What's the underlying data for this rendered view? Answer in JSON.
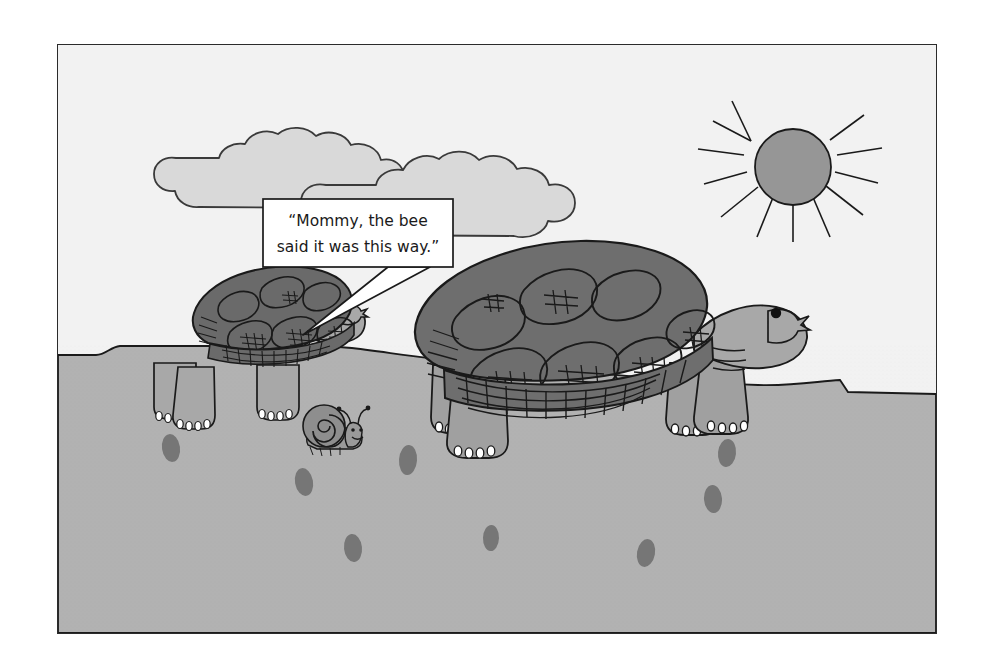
{
  "canvas": {
    "width": 994,
    "height": 669,
    "background": "#ffffff"
  },
  "panel": {
    "x": 57,
    "y": 44,
    "width": 878,
    "height": 588,
    "border_color": "#2b2b2b",
    "sky_color": "#f2f2f2",
    "ground_color": "#b2b2b2"
  },
  "palette": {
    "sky": "#f2f2f2",
    "ground": "#b2b2b2",
    "cloud_fill": "#d9d9d9",
    "sun_fill": "#969696",
    "shell_dark": "#6e6e6e",
    "shell_small": "#6a6a6a",
    "skin_light": "#a8a8a8",
    "outline": "#1a1a1a",
    "footprint": "#7a7a7a",
    "claw_white": "#ffffff",
    "bubble_fill": "#ffffff",
    "bleed_text": "#cfcfcf"
  },
  "speech_bubble": {
    "line1": "“Mommy, the bee",
    "line2": "said it was this way.”",
    "x": 262,
    "y": 198,
    "width": 190,
    "height": 68,
    "speaker": "small-tortoise"
  },
  "scene": {
    "title": "Two tortoises and a snail walking across sandy ground",
    "sun": {
      "cx": 750,
      "cy": 140,
      "r": 38,
      "rays": 12
    },
    "clouds": [
      {
        "name": "cloud-left",
        "cx": 260,
        "cy": 125
      },
      {
        "name": "cloud-right",
        "cx": 425,
        "cy": 138
      }
    ],
    "characters": [
      {
        "name": "small-tortoise",
        "role": "child",
        "facing": "right",
        "x": 145,
        "y": 285
      },
      {
        "name": "large-tortoise",
        "role": "mommy",
        "facing": "right",
        "x": 430,
        "y": 265
      },
      {
        "name": "snail",
        "role": "bystander",
        "x": 300,
        "y": 390
      }
    ],
    "footprints": [
      {
        "cx": 170,
        "cy": 447
      },
      {
        "cx": 303,
        "cy": 481
      },
      {
        "cx": 407,
        "cy": 459
      },
      {
        "cx": 352,
        "cy": 547
      },
      {
        "cx": 490,
        "cy": 537
      },
      {
        "cx": 645,
        "cy": 552
      },
      {
        "cx": 726,
        "cy": 452
      },
      {
        "cx": 712,
        "cy": 498
      }
    ],
    "horizon_note": "ground edge steps up near left margin and steps down near right margin"
  },
  "bleed_through": {
    "description": "faint mirrored text showing through from the reverse side of the page",
    "lines": [
      {
        "text": "Horowitz, M. and Symons, D. (1992). Whose Collectibles?",
        "x": 300,
        "y": 52
      },
      {
        "text": "Journal of Collecting and Culture, 9, 44-53.",
        "x": 330,
        "y": 78
      },
      {
        "text": "Hanson, E. H. (1982). Interpretation in writing. Psychology",
        "x": 300,
        "y": 186
      },
      {
        "text": "Today, 11, 272-280.",
        "x": 350,
        "y": 212
      },
      {
        "text": "Harding, F. J. (1988). Finding and making meaning in",
        "x": 285,
        "y": 268
      }
    ]
  }
}
